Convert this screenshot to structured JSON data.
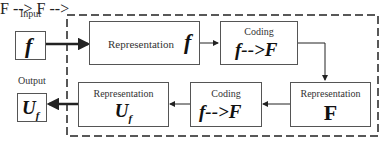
{
  "diagram": {
    "input": {
      "label": "Input",
      "symbol": "f"
    },
    "output": {
      "label": "Output",
      "symbol": "U",
      "symbol_sub": "f"
    },
    "boxes": [
      {
        "id": "rep-f",
        "caption": "Representation",
        "symbol": "f"
      },
      {
        "id": "coding-1",
        "caption": "Coding",
        "symbol": "f-->F"
      },
      {
        "id": "rep-F",
        "caption": "Representation",
        "symbol": "F"
      },
      {
        "id": "coding-2",
        "caption": "Coding",
        "symbol": "f-->F"
      },
      {
        "id": "rep-Uf",
        "caption": "Representation",
        "symbol": "U",
        "symbol_sub": "f"
      }
    ],
    "edges": [
      {
        "from": "input",
        "to": "rep-f"
      },
      {
        "from": "rep-f",
        "to": "coding-1"
      },
      {
        "from": "coding-1",
        "to": "rep-F"
      },
      {
        "from": "rep-F",
        "to": "coding-2"
      },
      {
        "from": "coding-2",
        "to": "rep-Uf"
      },
      {
        "from": "rep-Uf",
        "to": "output"
      }
    ],
    "colors": {
      "line": "#222222",
      "border": "#555555",
      "background": "#ffffff"
    }
  }
}
